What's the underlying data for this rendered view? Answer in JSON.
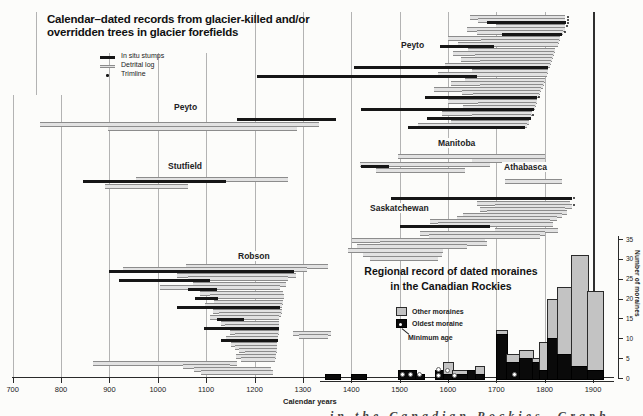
{
  "figure_title": {
    "line1": "Calendar–dated records from glacier-killed and/or",
    "line2": "overridden trees in glacier forefields"
  },
  "tree_legend": {
    "items": [
      {
        "label": "In situ stumps",
        "type": "insitu"
      },
      {
        "label": "Detrital log",
        "type": "detrital"
      },
      {
        "label": "Trimline",
        "type": "trimline"
      }
    ]
  },
  "x_axis": {
    "label": "Calendar years",
    "ticks": [
      700,
      800,
      900,
      1000,
      1100,
      1200,
      1300,
      1400,
      1500,
      1600,
      1700,
      1800,
      1900
    ],
    "min": 700,
    "max": 1950
  },
  "moraine_panel": {
    "title_line1": "Regional record of dated moraines",
    "title_line2": "in the Canadian Rockies",
    "legend": [
      {
        "label": "Other moraines",
        "type": "other"
      },
      {
        "label": "Oldest moraine",
        "type": "oldest"
      },
      {
        "label": "Minimum age",
        "type": "minage"
      }
    ],
    "y_axis": {
      "label": "Number of moraines",
      "ticks": [
        0,
        5,
        10,
        15,
        20,
        25,
        30,
        35
      ]
    }
  },
  "caption_fragment": "in the Canadian Rockies. Graph",
  "colors": {
    "insitu": "#161616",
    "detrital": "#9b9b9b",
    "other_moraine": "#c3c3c3",
    "oldest_moraine": "#0a0a0a",
    "grid": "#b3b3b3",
    "grid_dark": "#2f2f2f",
    "axis": "#2a2a2a"
  },
  "chart_data": [
    {
      "type": "gantt",
      "title": "Calendar-dated records from glacier-killed and/or overridden trees in glacier forefields",
      "x_unit": "calendar year AD",
      "x_range": [
        700,
        1950
      ],
      "bar_types": {
        "d": "In situ stumps",
        "g": "Detrital log",
        "dot": "Trimline"
      },
      "groups": [
        {
          "name": "Peyto",
          "label_xy": [
            399,
            40
          ],
          "bars": [
            [
              15,
              "g",
              1645,
              1843
            ],
            [
              18,
              "g",
              1662,
              1843
            ],
            [
              21,
              "d",
              1680,
              1844
            ],
            [
              24,
              "g",
              1700,
              1842
            ],
            [
              27,
              "g",
              1639,
              1842
            ],
            [
              30,
              "g",
              1660,
              1838
            ],
            [
              33,
              "d",
              1712,
              1835
            ],
            [
              36,
              "g",
              1600,
              1831
            ],
            [
              39,
              "g",
              1668,
              1830
            ],
            [
              42,
              "g",
              1621,
              1828
            ],
            [
              45,
              "d",
              1583,
              1695
            ],
            [
              48,
              "g",
              1641,
              1821
            ],
            [
              51,
              "g",
              1610,
              1819
            ],
            [
              54,
              "g",
              1656,
              1817
            ],
            [
              57,
              "g",
              1627,
              1815
            ],
            [
              60,
              "g",
              1666,
              1814
            ],
            [
              63,
              "g",
              1594,
              1811
            ],
            [
              66,
              "d",
              1406,
              1807
            ],
            [
              69,
              "g",
              1650,
              1807
            ],
            [
              72,
              "g",
              1580,
              1804
            ],
            [
              75,
              "d",
              1205,
              1660
            ],
            [
              78,
              "g",
              1636,
              1800
            ],
            [
              81,
              "g",
              1607,
              1798
            ],
            [
              84,
              "g",
              1666,
              1796
            ],
            [
              87,
              "g",
              1571,
              1793
            ],
            [
              90,
              "g",
              1629,
              1791
            ],
            [
              93,
              "g",
              1652,
              1789
            ],
            [
              96,
              "d",
              1553,
              1785
            ],
            [
              99,
              "g",
              1600,
              1785
            ],
            [
              102,
              "g",
              1662,
              1782
            ],
            [
              105,
              "g",
              1631,
              1780
            ],
            [
              108,
              "d",
              1420,
              1778
            ],
            [
              111,
              "g",
              1587,
              1774
            ],
            [
              114,
              "g",
              1650,
              1772
            ],
            [
              117,
              "d",
              1557,
              1771
            ],
            [
              120,
              "g",
              1607,
              1768
            ],
            [
              123,
              "g",
              1538,
              1764
            ],
            [
              126,
              "d",
              1517,
              1760
            ]
          ],
          "dots": [
            [
              1847,
              16
            ],
            [
              1847,
              19
            ],
            [
              1846,
              22
            ],
            [
              1845,
              25
            ],
            [
              1841,
              31
            ],
            [
              1786,
              96
            ],
            [
              1773,
              114
            ]
          ]
        },
        {
          "name": "Peyto",
          "label_xy": [
            172,
            102
          ],
          "bars": [
            [
              118,
              "d",
              1163,
              1368
            ],
            [
              122,
              "g",
              757,
              1333
            ],
            [
              126,
              "g",
              897,
              1288
            ]
          ],
          "dots": []
        },
        {
          "name": "Stutfield",
          "label_xy": [
            166,
            161
          ],
          "bars": [
            [
              177,
              "g",
              955,
              1270
            ],
            [
              180,
              "d",
              845,
              1142
            ],
            [
              184,
              "g",
              890,
              1062
            ]
          ],
          "dots": []
        },
        {
          "name": "Manitoba",
          "label_xy": [
            436,
            138
          ],
          "bars": [
            [
              154,
              "g",
              1497,
              1800
            ],
            [
              158,
              "g",
              1650,
              1800
            ],
            [
              162,
              "g",
              1418,
              1688
            ],
            [
              165,
              "d",
              1420,
              1478
            ],
            [
              168,
              "g",
              1452,
              1635
            ]
          ],
          "dots": []
        },
        {
          "name": "Athabasca",
          "label_xy": [
            502,
            162
          ],
          "bars": [
            [
              179,
              "g",
              1718,
              1836
            ]
          ],
          "dots": []
        },
        {
          "name": "Saskatchewan",
          "label_xy": [
            368,
            203
          ],
          "bars": [
            [
              197,
              "d",
              1483,
              1856
            ],
            [
              201,
              "g",
              1660,
              1852
            ],
            [
              204,
              "g",
              1697,
              1856
            ],
            [
              207,
              "g",
              1666,
              1842
            ],
            [
              210,
              "g",
              1680,
              1846
            ],
            [
              213,
              "g",
              1631,
              1836
            ],
            [
              216,
              "g",
              1618,
              1825
            ],
            [
              219,
              "g",
              1563,
              1811
            ],
            [
              222,
              "g",
              1580,
              1817
            ],
            [
              225,
              "d",
              1501,
              1687
            ],
            [
              228,
              "g",
              1697,
              1827
            ],
            [
              231,
              "g",
              1542,
              1800
            ],
            [
              234,
              "g",
              1560,
              1790
            ],
            [
              238,
              "g",
              1402,
              1677
            ],
            [
              241,
              "g",
              1460,
              1681
            ],
            [
              244,
              "g",
              1412,
              1639
            ],
            [
              248,
              "g",
              1394,
              1590
            ],
            [
              252,
              "g",
              1424,
              1588
            ],
            [
              256,
              "g",
              1438,
              1580
            ]
          ],
          "dots": [
            [
              1858,
              197
            ],
            [
              1859,
              204
            ]
          ]
        },
        {
          "name": "Robson",
          "label_xy": [
            236,
            251
          ],
          "bars": [
            [
              264,
              "g",
              1058,
              1352
            ],
            [
              267,
              "g",
              928,
              1309
            ],
            [
              270,
              "d",
              900,
              1282
            ],
            [
              273,
              "g",
              1040,
              1285
            ],
            [
              276,
              "g",
              1063,
              1270
            ],
            [
              279,
              "d",
              920,
              1107
            ],
            [
              282,
              "g",
              1072,
              1266
            ],
            [
              285,
              "g",
              1005,
              1252
            ],
            [
              288,
              "d",
              1062,
              1122
            ],
            [
              291,
              "g",
              1087,
              1259
            ],
            [
              294,
              "g",
              1107,
              1262
            ],
            [
              297,
              "d",
              1077,
              1125
            ],
            [
              300,
              "g",
              1117,
              1258
            ],
            [
              303,
              "g",
              1097,
              1256
            ],
            [
              306,
              "d",
              1040,
              1252
            ],
            [
              309,
              "g",
              1114,
              1256
            ],
            [
              312,
              "g",
              1127,
              1255
            ],
            [
              315,
              "g",
              1107,
              1250
            ],
            [
              318,
              "d",
              1122,
              1178
            ],
            [
              321,
              "g",
              1130,
              1251
            ],
            [
              324,
              "g",
              1140,
              1250
            ],
            [
              327,
              "d",
              1095,
              1250
            ],
            [
              330,
              "g",
              1150,
              1250
            ],
            [
              333,
              "g",
              1160,
              1249
            ],
            [
              336,
              "g",
              1142,
              1248
            ],
            [
              339,
              "d",
              1130,
              1248
            ],
            [
              342,
              "g",
              1152,
              1247
            ],
            [
              345,
              "g",
              1160,
              1246
            ],
            [
              348,
              "g",
              1168,
              1246
            ],
            [
              351,
              "g",
              1180,
              1245
            ],
            [
              354,
              "g",
              1162,
              1244
            ],
            [
              357,
              "g",
              1173,
              1243
            ],
            [
              361,
              "g",
              866,
              1163
            ],
            [
              364,
              "g",
              1052,
              1150
            ],
            [
              367,
              "g",
              1075,
              1235
            ],
            [
              370,
              "g",
              1090,
              1238
            ],
            [
              331,
              "g",
              1280,
              1358
            ],
            [
              334,
              "g",
              1293,
              1352
            ]
          ],
          "dots": []
        }
      ]
    },
    {
      "type": "bar",
      "title": "Regional record of dated moraines in the Canadian Rockies",
      "stacked": true,
      "x_unit": "calendar year AD",
      "ylabel": "Number of moraines",
      "ylim": [
        0,
        35
      ],
      "legend_position": "upper-left-of-panel",
      "series_names": [
        "Oldest moraine",
        "Other moraines"
      ],
      "bars": [
        {
          "range": [
            1345,
            1375
          ],
          "oldest": 1,
          "other": 0
        },
        {
          "range": [
            1400,
            1428
          ],
          "oldest": 1,
          "other": 0
        },
        {
          "range": [
            1497,
            1532
          ],
          "oldest": 2,
          "other": 0
        },
        {
          "range": [
            1532,
            1549
          ],
          "oldest": 1,
          "other": 0
        },
        {
          "range": [
            1573,
            1590
          ],
          "oldest": 2,
          "other": 0
        },
        {
          "range": [
            1590,
            1608
          ],
          "oldest": 1,
          "other": 3
        },
        {
          "range": [
            1608,
            1639
          ],
          "oldest": 1,
          "other": 1
        },
        {
          "range": [
            1639,
            1656
          ],
          "oldest": 2,
          "other": 0
        },
        {
          "range": [
            1656,
            1672
          ],
          "oldest": 1,
          "other": 2
        },
        {
          "range": [
            1700,
            1720
          ],
          "oldest": 11,
          "other": 1
        },
        {
          "range": [
            1720,
            1747
          ],
          "oldest": 4,
          "other": 2
        },
        {
          "range": [
            1747,
            1773
          ],
          "oldest": 5,
          "other": 2
        },
        {
          "range": [
            1773,
            1788
          ],
          "oldest": 4,
          "other": 1
        },
        {
          "range": [
            1788,
            1804
          ],
          "oldest": 2,
          "other": 7
        },
        {
          "range": [
            1804,
            1826
          ],
          "oldest": 10,
          "other": 10
        },
        {
          "range": [
            1826,
            1854
          ],
          "oldest": 6,
          "other": 17
        },
        {
          "range": [
            1854,
            1888
          ],
          "oldest": 3,
          "other": 28
        },
        {
          "range": [
            1888,
            1918
          ],
          "oldest": 2,
          "other": 20
        }
      ],
      "min_age_dots": [
        [
          1505,
          5
        ],
        [
          1520,
          5
        ],
        [
          1540,
          5
        ],
        [
          1578,
          10
        ],
        [
          1578,
          4
        ],
        [
          1598,
          9
        ],
        [
          1612,
          4
        ],
        [
          1735,
          5
        ]
      ]
    }
  ]
}
